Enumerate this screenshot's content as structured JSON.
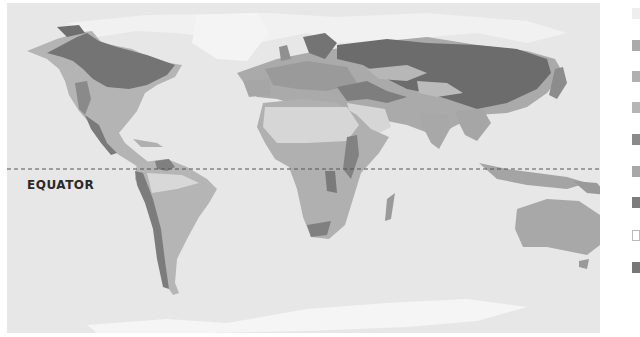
{
  "map": {
    "title": "World biome map",
    "equator_label": "EQUATOR",
    "colors": {
      "ocean": "#e7e7e7",
      "ice": "#f4f4f4",
      "tundra_light": "#eeeeee",
      "desert": "#d8d8d8",
      "grassland": "#b9b9b9",
      "savanna": "#acacac",
      "temperate_forest": "#9a9a9a",
      "mountain": "#858585",
      "boreal_forest": "#767676"
    }
  },
  "legend": {
    "items": [
      {
        "color": "#eeeeee",
        "label": ""
      },
      {
        "color": "#aaaaaa",
        "label": ""
      },
      {
        "color": "#b0b0b0",
        "label": ""
      },
      {
        "color": "#b5b5b5",
        "label": ""
      },
      {
        "color": "#8a8a8a",
        "label": ""
      },
      {
        "color": "#a8a8a8",
        "label": ""
      },
      {
        "color": "#7c7c7c",
        "label": ""
      },
      {
        "color": "#ffffff",
        "label": ""
      },
      {
        "color": "#777777",
        "label": ""
      }
    ]
  }
}
